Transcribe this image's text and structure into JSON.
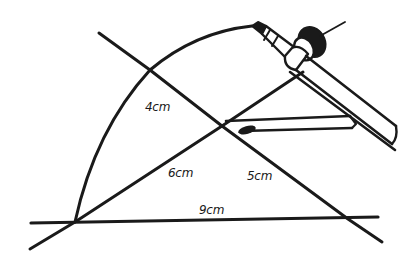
{
  "diagram": {
    "type": "compass-construction-triangle",
    "stroke_color": "#1a1a1a",
    "background": "#ffffff",
    "labels": {
      "arc_radius_left": "4cm",
      "side_left": "6cm",
      "side_right": "5cm",
      "base": "9cm"
    },
    "elements": [
      "base-line",
      "left-side-line",
      "right-side-line",
      "construction-arc",
      "compass-pencil-arm",
      "compass-hinge",
      "compass-needle",
      "compass-second-arm"
    ]
  }
}
